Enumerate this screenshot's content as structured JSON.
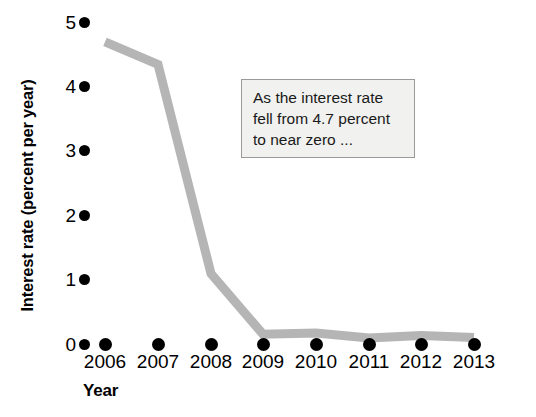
{
  "chart_data": {
    "type": "line",
    "title": "",
    "xlabel": "Year",
    "ylabel": "Interest rate (percent per year)",
    "categories": [
      "2006",
      "2007",
      "2008",
      "2009",
      "2010",
      "2011",
      "2012",
      "2013"
    ],
    "x": [
      2006,
      2007,
      2008,
      2009,
      2010,
      2011,
      2012,
      2013
    ],
    "values": [
      4.7,
      4.35,
      1.1,
      0.16,
      0.18,
      0.1,
      0.14,
      0.11
    ],
    "series": [
      {
        "name": "Interest rate",
        "values": [
          4.7,
          4.35,
          1.1,
          0.16,
          0.18,
          0.1,
          0.14,
          0.11
        ]
      }
    ],
    "ylim": [
      0,
      5
    ],
    "yticks": [
      0,
      1,
      2,
      3,
      4,
      5
    ],
    "ytick_labels": [
      "0",
      "1",
      "2",
      "3",
      "4",
      "5"
    ],
    "grid": false,
    "legend": false,
    "legend_position": "none",
    "line_color": "#b5b5b5",
    "marker_color": "#000000",
    "annotations": [
      {
        "lines": [
          "As the interest rate",
          "fell from 4.7 percent",
          "to near zero ..."
        ],
        "fill_color": "#f1f1ef",
        "border_color": "#9a9a9a"
      }
    ]
  },
  "axes": {
    "y": {
      "title": "Interest rate (percent per year)",
      "ticks": [
        {
          "label": "5",
          "value": 5
        },
        {
          "label": "4",
          "value": 4
        },
        {
          "label": "3",
          "value": 3
        },
        {
          "label": "2",
          "value": 2
        },
        {
          "label": "1",
          "value": 1
        },
        {
          "label": "0",
          "value": 0
        }
      ]
    },
    "x": {
      "title": "Year",
      "ticks": [
        {
          "label": "2006"
        },
        {
          "label": "2007"
        },
        {
          "label": "2008"
        },
        {
          "label": "2009"
        },
        {
          "label": "2010"
        },
        {
          "label": "2011"
        },
        {
          "label": "2012"
        },
        {
          "label": "2013"
        }
      ]
    }
  },
  "annotation": {
    "line1": "As the interest rate",
    "line2": "fell from 4.7 percent",
    "line3": "to near zero ..."
  }
}
